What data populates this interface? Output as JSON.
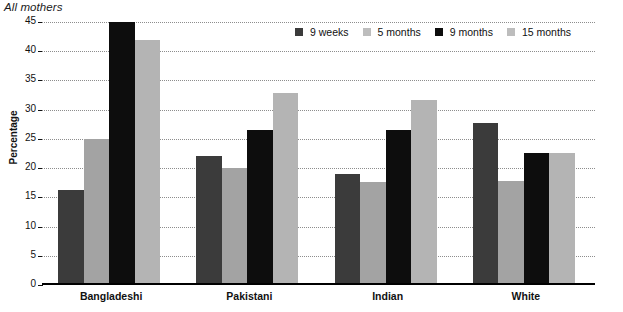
{
  "chart_data": {
    "type": "bar",
    "title": "All mothers",
    "xlabel": "",
    "ylabel": "Percentage",
    "ylim": [
      0,
      45
    ],
    "ytick_step": 5,
    "yticks": [
      0,
      5,
      10,
      15,
      20,
      25,
      30,
      35,
      40,
      45
    ],
    "grid": true,
    "legend_position": "top-center",
    "categories": [
      "Bangladeshi",
      "Pakistani",
      "Indian",
      "White"
    ],
    "series": [
      {
        "name": "9 weeks",
        "color": "#3b3b3b",
        "values": [
          16.2,
          22.0,
          19.0,
          27.7
        ]
      },
      {
        "name": "5 months",
        "color": "#a3a3a3",
        "values": [
          25.0,
          20.0,
          17.7,
          17.8
        ]
      },
      {
        "name": "9 months",
        "color": "#0d0d0d",
        "values": [
          45.0,
          26.6,
          26.5,
          22.6
        ]
      },
      {
        "name": "15 months",
        "color": "#b4b4b4",
        "values": [
          42.0,
          32.8,
          31.6,
          22.6
        ]
      }
    ]
  },
  "axis": {
    "y_title": "Percentage",
    "tick_labels": [
      "45",
      "40",
      "35",
      "30",
      "25",
      "20",
      "15",
      "10",
      "5",
      "0"
    ]
  },
  "legend": {
    "items": [
      {
        "label": "9 weeks"
      },
      {
        "label": "5 months"
      },
      {
        "label": "9 months"
      },
      {
        "label": "15 months"
      }
    ]
  }
}
